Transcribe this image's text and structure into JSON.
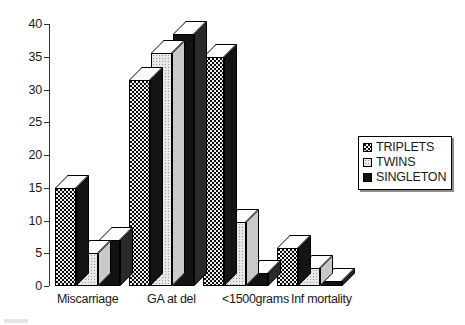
{
  "chart_data": {
    "type": "bar",
    "title": "",
    "subtitle": "",
    "xlabel": "",
    "ylabel": "",
    "categories": [
      "Miscarriage",
      "GA at del",
      "<1500grams",
      "Inf mortality"
    ],
    "series": [
      {
        "name": "TRIPLETS",
        "values": [
          15,
          31.5,
          35,
          5.8
        ]
      },
      {
        "name": "TWINS",
        "values": [
          5,
          35.5,
          9.7,
          2.8
        ]
      },
      {
        "name": "SINGLETON",
        "values": [
          7,
          38.5,
          2,
          0.8
        ]
      }
    ],
    "ylim": [
      0,
      40
    ],
    "yticks": [
      0,
      5,
      10,
      15,
      20,
      25,
      30,
      35,
      40
    ],
    "ytick_labels": [
      "0",
      "5",
      "10",
      "15",
      "20",
      "25",
      "30",
      "35",
      "40"
    ],
    "grid": false,
    "legend_position": "right",
    "three_d": true
  },
  "legend": {
    "items": [
      {
        "label": "TRIPLETS",
        "swatch": "checkered-dark-swatch"
      },
      {
        "label": "TWINS",
        "swatch": "dotted-light-swatch"
      },
      {
        "label": "SINGLETON",
        "swatch": "solid-black-swatch"
      }
    ]
  }
}
